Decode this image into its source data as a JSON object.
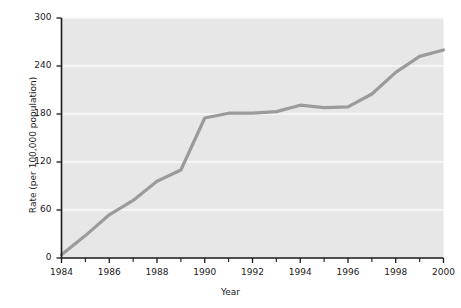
{
  "chart_data": {
    "type": "line",
    "title": "",
    "xlabel": "Year",
    "ylabel": "Rate (per 100,000 population)",
    "x": [
      1984,
      1985,
      1986,
      1987,
      1988,
      1989,
      1990,
      1991,
      1992,
      1993,
      1994,
      1995,
      1996,
      1997,
      1998,
      1999,
      2000
    ],
    "values": [
      4,
      28,
      54,
      72,
      96,
      110,
      175,
      181,
      181,
      183,
      191,
      188,
      189,
      205,
      232,
      252,
      260
    ],
    "series": [
      {
        "name": "Rate",
        "values": [
          4,
          28,
          54,
          72,
          96,
          110,
          175,
          181,
          181,
          183,
          191,
          188,
          189,
          205,
          232,
          252,
          260
        ]
      }
    ],
    "xlim": [
      1984,
      2000
    ],
    "ylim": [
      0,
      300
    ],
    "yticks": [
      0,
      60,
      120,
      180,
      240,
      300
    ],
    "ytick_labels": [
      "0",
      "60",
      "120",
      "180",
      "240",
      "300"
    ],
    "xticks": [
      1984,
      1986,
      1988,
      1990,
      1992,
      1994,
      1996,
      1998,
      2000
    ],
    "xtick_labels": [
      "1984",
      "1986",
      "1988",
      "1990",
      "1992",
      "1994",
      "1996",
      "1998",
      "2000"
    ],
    "xminor_ticks": [
      1985,
      1987,
      1989,
      1991,
      1993,
      1995,
      1997,
      1999
    ],
    "grid": true,
    "grid_axis": "y",
    "legend": false,
    "legend_position": "none",
    "colors": {
      "line": "#9b9b9b",
      "plot_background": "#e7e7e7",
      "gridline": "#fafafa",
      "axis": "#1a1a1a",
      "page_background": "#ffffff",
      "text": "#1a1a1a"
    },
    "line_width": 3.2
  }
}
